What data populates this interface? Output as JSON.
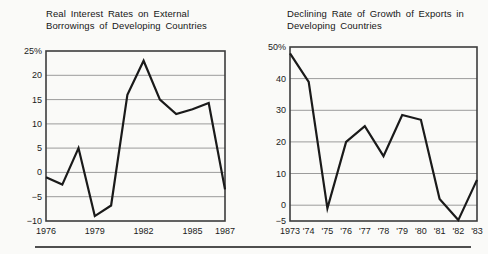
{
  "figure": {
    "background_color": "#fafaf8",
    "bottom_rule_color": "#4f4f4f"
  },
  "chart_data": [
    {
      "type": "line",
      "title": "Real Interest Rates on External Borrowings of Developing Countries",
      "title_lines": [
        "Real Interest Rates on External",
        "Borrowings of Developing Countries"
      ],
      "x": [
        1976,
        1977,
        1978,
        1979,
        1980,
        1981,
        1982,
        1983,
        1984,
        1985,
        1986,
        1987
      ],
      "values": [
        -1,
        -2.5,
        5,
        -9,
        -6.8,
        16,
        23,
        15,
        12,
        13,
        14.3,
        -3.5
      ],
      "ylim": [
        -10,
        25
      ],
      "ytick_values": [
        25,
        20,
        15,
        10,
        5,
        0,
        -5,
        -10
      ],
      "ytick_labels": [
        "25%",
        "20",
        "15",
        "10",
        "5",
        "0",
        "−5",
        "−10"
      ],
      "xtick_values": [
        1976,
        1979,
        1982,
        1985,
        1987
      ],
      "xtick_labels": [
        "1976",
        "1979",
        "1982",
        "1985",
        "1987"
      ],
      "xlabel": "",
      "ylabel": "",
      "grid": true,
      "legend": false,
      "line_color": "#1a1a1a",
      "grid_color": "#9b9b9b",
      "frame_color": "#3d3d3d",
      "text_color": "#1b1b1b"
    },
    {
      "type": "line",
      "title": "Declining Rate of Growth of Exports in Developing Countries",
      "title_lines": [
        "Declining Rate of Growth of Exports in",
        "Developing Countries"
      ],
      "x": [
        1973,
        1974,
        1975,
        1976,
        1977,
        1978,
        1979,
        1980,
        1981,
        1982,
        1983
      ],
      "values": [
        48,
        39,
        -1,
        20,
        25,
        15.5,
        28.5,
        27,
        2,
        -4.7,
        8
      ],
      "ylim": [
        -5,
        50
      ],
      "ytick_values": [
        50,
        40,
        30,
        20,
        10,
        0,
        -5
      ],
      "ytick_labels": [
        "50%",
        "40",
        "30",
        "20",
        "10",
        "0",
        "−5"
      ],
      "xtick_values": [
        1973,
        1974,
        1975,
        1976,
        1977,
        1978,
        1979,
        1980,
        1981,
        1982,
        1983
      ],
      "xtick_labels": [
        "1973",
        "'74",
        "'75",
        "'76",
        "'77",
        "'78",
        "'79",
        "'80",
        "'81",
        "'82",
        "'83"
      ],
      "xlabel": "",
      "ylabel": "",
      "grid": true,
      "legend": false,
      "line_color": "#1a1a1a",
      "grid_color": "#9b9b9b",
      "frame_color": "#3d3d3d",
      "text_color": "#1b1b1b"
    }
  ]
}
